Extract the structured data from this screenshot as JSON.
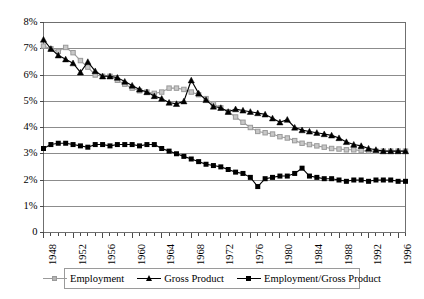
{
  "chart_data": {
    "type": "line",
    "title": "",
    "subtitle": "",
    "xlabel": "",
    "ylabel": "",
    "grid": true,
    "legend_position": "bottom",
    "xlim": [
      1948,
      1997
    ],
    "ylim": [
      0,
      0.08
    ],
    "y_tick_labels": [
      "8%",
      "7%",
      "6%",
      "5%",
      "4%",
      "3%",
      "2%",
      "1%",
      "0"
    ],
    "y_tick_values": [
      8,
      7,
      6,
      5,
      4,
      3,
      2,
      1,
      0
    ],
    "x_tick_labels": [
      "1948",
      "1952",
      "1956",
      "1960",
      "1964",
      "1968",
      "1972",
      "1976",
      "1980",
      "1984",
      "1988",
      "1992",
      "1996"
    ],
    "x_tick_values": [
      1948,
      1952,
      1956,
      1960,
      1964,
      1968,
      1972,
      1976,
      1980,
      1984,
      1988,
      1992,
      1996
    ],
    "x": [
      1948,
      1949,
      1950,
      1951,
      1952,
      1953,
      1954,
      1955,
      1956,
      1957,
      1958,
      1959,
      1960,
      1961,
      1962,
      1963,
      1964,
      1965,
      1966,
      1967,
      1968,
      1969,
      1970,
      1971,
      1972,
      1973,
      1974,
      1975,
      1976,
      1977,
      1978,
      1979,
      1980,
      1981,
      1982,
      1983,
      1984,
      1985,
      1986,
      1987,
      1988,
      1989,
      1990,
      1991,
      1992,
      1993,
      1994,
      1995,
      1996,
      1997
    ],
    "series": [
      {
        "name": "Employment",
        "color": "#9a9a9a",
        "marker": "square-open",
        "values": [
          7.1,
          7.0,
          6.9,
          7.05,
          6.85,
          6.55,
          6.3,
          6.0,
          5.95,
          5.95,
          5.8,
          5.65,
          5.5,
          5.4,
          5.35,
          5.3,
          5.35,
          5.5,
          5.5,
          5.45,
          5.35,
          5.25,
          5.1,
          4.9,
          4.75,
          4.6,
          4.4,
          4.2,
          4.0,
          3.85,
          3.8,
          3.75,
          3.65,
          3.6,
          3.5,
          3.4,
          3.35,
          3.3,
          3.25,
          3.2,
          3.18,
          3.15,
          3.15,
          3.12,
          3.1,
          3.1,
          3.1,
          3.1,
          3.1,
          3.1
        ]
      },
      {
        "name": "Gross Product",
        "color": "#000000",
        "marker": "triangle",
        "values": [
          7.35,
          7.0,
          6.75,
          6.6,
          6.45,
          6.1,
          6.5,
          6.15,
          5.95,
          5.95,
          5.9,
          5.75,
          5.6,
          5.45,
          5.35,
          5.2,
          5.1,
          4.95,
          4.9,
          5.0,
          5.8,
          5.3,
          5.05,
          4.8,
          4.75,
          4.6,
          4.7,
          4.65,
          4.6,
          4.55,
          4.5,
          4.35,
          4.2,
          4.3,
          4.0,
          3.9,
          3.85,
          3.8,
          3.75,
          3.7,
          3.6,
          3.45,
          3.35,
          3.3,
          3.2,
          3.15,
          3.1,
          3.1,
          3.1,
          3.1
        ]
      },
      {
        "name": "Employment/Gross Product",
        "color": "#000000",
        "marker": "square-filled",
        "values": [
          3.2,
          3.35,
          3.4,
          3.4,
          3.35,
          3.3,
          3.25,
          3.35,
          3.35,
          3.3,
          3.35,
          3.35,
          3.35,
          3.3,
          3.35,
          3.35,
          3.2,
          3.1,
          3.0,
          2.9,
          2.8,
          2.7,
          2.6,
          2.55,
          2.5,
          2.4,
          2.3,
          2.25,
          2.1,
          1.75,
          2.05,
          2.1,
          2.15,
          2.15,
          2.25,
          2.45,
          2.15,
          2.1,
          2.05,
          2.05,
          2.0,
          1.95,
          2.0,
          2.0,
          1.95,
          2.0,
          2.0,
          2.0,
          1.95,
          1.95
        ]
      }
    ]
  },
  "legend": {
    "items": [
      {
        "label": "Employment",
        "marker": "square-open",
        "color": "#9a9a9a"
      },
      {
        "label": "Gross Product",
        "marker": "triangle",
        "color": "#000000"
      },
      {
        "label": "Employment/Gross Product",
        "marker": "square-filled",
        "color": "#000000"
      }
    ]
  }
}
